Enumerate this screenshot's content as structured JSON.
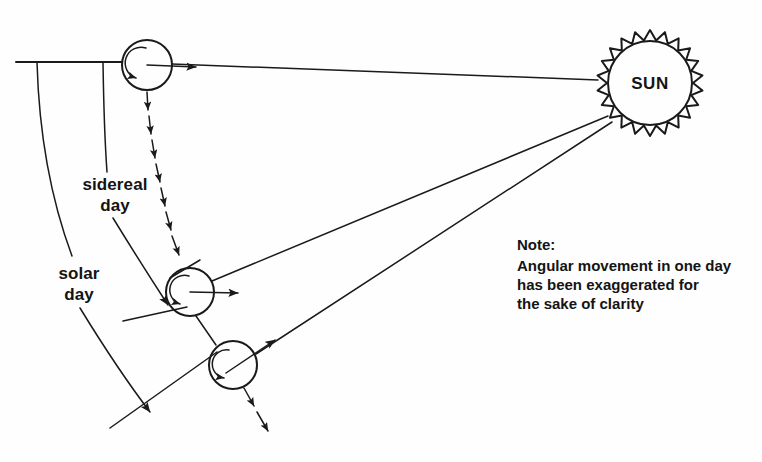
{
  "diagram": {
    "background_color": "#fefefe",
    "ink_color": "#1a1a1a",
    "sun": {
      "label": "SUN",
      "center_x": 650,
      "center_y": 83,
      "inner_radius": 42,
      "outer_radius": 53,
      "spike_count": 22
    },
    "earth_positions": [
      {
        "name": "earth-top",
        "cx": 147,
        "cy": 65,
        "r": 25
      },
      {
        "name": "earth-middle",
        "cx": 190,
        "cy": 292,
        "r": 24
      },
      {
        "name": "earth-bottom",
        "cx": 233,
        "cy": 365,
        "r": 24
      }
    ],
    "labels": {
      "sidereal_day_line1": "sidereal",
      "sidereal_day_line2": "day",
      "solar_day_line1": "solar",
      "solar_day_line2": "day"
    },
    "note": {
      "title": "Note:",
      "line1": "Angular movement in one day",
      "line2": "has been exaggerated for",
      "line3": "the sake of clarity"
    }
  }
}
